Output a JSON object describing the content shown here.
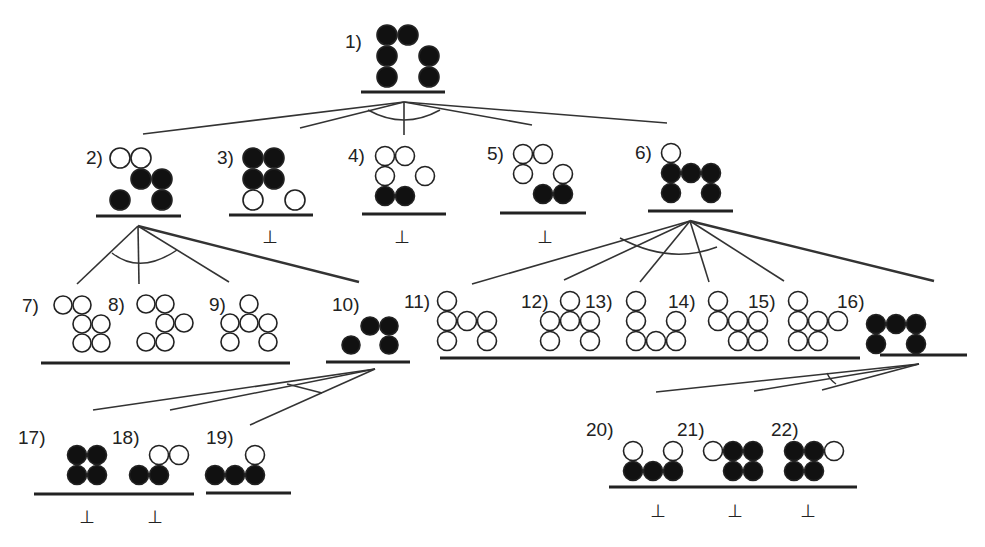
{
  "diagram": {
    "type": "search-tree",
    "colors": {
      "filled": "#111111",
      "hollow": "#ffffff",
      "stroke": "#222222",
      "line": "#333333"
    },
    "bottom_symbol": "⊥",
    "nodes": [
      {
        "id": "1",
        "label": "1)",
        "dead_end": false,
        "circles": [
          [
            0,
            0,
            1
          ],
          [
            1,
            0,
            1
          ],
          [
            0,
            1,
            1
          ],
          [
            2,
            1,
            1
          ],
          [
            0,
            2,
            1
          ],
          [
            2,
            2,
            1
          ]
        ]
      },
      {
        "id": "2",
        "label": "2)",
        "dead_end": false,
        "circles": [
          [
            0,
            0,
            0
          ],
          [
            1,
            0,
            0
          ],
          [
            1,
            1,
            1
          ],
          [
            2,
            1,
            1
          ],
          [
            0,
            2,
            1
          ],
          [
            2,
            2,
            1
          ]
        ]
      },
      {
        "id": "3",
        "label": "3)",
        "dead_end": true,
        "circles": [
          [
            0,
            0,
            1
          ],
          [
            1,
            0,
            1
          ],
          [
            0,
            1,
            1
          ],
          [
            1,
            1,
            1
          ],
          [
            0,
            2,
            0
          ],
          [
            2,
            2,
            0
          ]
        ]
      },
      {
        "id": "4",
        "label": "4)",
        "dead_end": true,
        "circles": [
          [
            0,
            0,
            0
          ],
          [
            1,
            0,
            0
          ],
          [
            0,
            1,
            0
          ],
          [
            2,
            1,
            0
          ],
          [
            0,
            2,
            1
          ],
          [
            1,
            2,
            1
          ]
        ]
      },
      {
        "id": "5",
        "label": "5)",
        "dead_end": true,
        "circles": [
          [
            0,
            0,
            0
          ],
          [
            1,
            0,
            0
          ],
          [
            0,
            1,
            0
          ],
          [
            2,
            1,
            0
          ],
          [
            1,
            2,
            1
          ],
          [
            2,
            2,
            1
          ]
        ]
      },
      {
        "id": "6",
        "label": "6)",
        "dead_end": false,
        "circles": [
          [
            0,
            0,
            0
          ],
          [
            0,
            1,
            1
          ],
          [
            1,
            1,
            1
          ],
          [
            2,
            1,
            1
          ],
          [
            0,
            2,
            1
          ],
          [
            2,
            2,
            1
          ]
        ]
      },
      {
        "id": "7",
        "label": "7)",
        "dead_end": false,
        "circles": [
          [
            0,
            0,
            0
          ],
          [
            1,
            0,
            0
          ],
          [
            1,
            1,
            0
          ],
          [
            2,
            1,
            0
          ],
          [
            1,
            2,
            0
          ],
          [
            2,
            2,
            0
          ]
        ]
      },
      {
        "id": "8",
        "label": "8)",
        "dead_end": false,
        "circles": [
          [
            0,
            0,
            0
          ],
          [
            1,
            0,
            0
          ],
          [
            1,
            1,
            0
          ],
          [
            2,
            1,
            0
          ],
          [
            0,
            2,
            0
          ],
          [
            1,
            2,
            0
          ]
        ]
      },
      {
        "id": "9",
        "label": "9)",
        "dead_end": false,
        "circles": [
          [
            1,
            0,
            0
          ],
          [
            0,
            1,
            0
          ],
          [
            1,
            1,
            0
          ],
          [
            2,
            1,
            0
          ],
          [
            0,
            2,
            0
          ],
          [
            2,
            2,
            0
          ]
        ]
      },
      {
        "id": "10",
        "label": "10)",
        "dead_end": false,
        "circles": [
          [
            1,
            1,
            1
          ],
          [
            2,
            1,
            1
          ],
          [
            0,
            2,
            1
          ],
          [
            2,
            2,
            1
          ]
        ]
      },
      {
        "id": "11",
        "label": "11)",
        "dead_end": false,
        "circles": [
          [
            0,
            0,
            0
          ],
          [
            0,
            1,
            0
          ],
          [
            1,
            1,
            0
          ],
          [
            2,
            1,
            0
          ],
          [
            0,
            2,
            0
          ],
          [
            2,
            2,
            0
          ]
        ]
      },
      {
        "id": "12",
        "label": "12)",
        "dead_end": false,
        "circles": [
          [
            1,
            0,
            0
          ],
          [
            0,
            1,
            0
          ],
          [
            1,
            1,
            0
          ],
          [
            2,
            1,
            0
          ],
          [
            0,
            2,
            0
          ],
          [
            2,
            2,
            0
          ]
        ]
      },
      {
        "id": "13",
        "label": "13)",
        "dead_end": false,
        "circles": [
          [
            0,
            0,
            0
          ],
          [
            0,
            1,
            0
          ],
          [
            2,
            1,
            0
          ],
          [
            0,
            2,
            0
          ],
          [
            1,
            2,
            0
          ],
          [
            2,
            2,
            0
          ]
        ]
      },
      {
        "id": "14",
        "label": "14)",
        "dead_end": false,
        "circles": [
          [
            0,
            0,
            0
          ],
          [
            0,
            1,
            0
          ],
          [
            1,
            1,
            0
          ],
          [
            2,
            1,
            0
          ],
          [
            1,
            2,
            0
          ],
          [
            2,
            2,
            0
          ]
        ]
      },
      {
        "id": "15",
        "label": "15)",
        "dead_end": false,
        "circles": [
          [
            0,
            0,
            0
          ],
          [
            0,
            1,
            0
          ],
          [
            1,
            1,
            0
          ],
          [
            2,
            1,
            0
          ],
          [
            0,
            2,
            0
          ],
          [
            1,
            2,
            0
          ]
        ]
      },
      {
        "id": "16",
        "label": "16)",
        "dead_end": false,
        "circles": [
          [
            0,
            1,
            1
          ],
          [
            1,
            1,
            1
          ],
          [
            2,
            1,
            1
          ],
          [
            0,
            2,
            1
          ],
          [
            2,
            2,
            1
          ]
        ]
      },
      {
        "id": "17",
        "label": "17)",
        "dead_end": true,
        "circles": [
          [
            0,
            1,
            1
          ],
          [
            1,
            1,
            1
          ],
          [
            0,
            2,
            1
          ],
          [
            1,
            2,
            1
          ]
        ]
      },
      {
        "id": "18",
        "label": "18)",
        "dead_end": true,
        "circles": [
          [
            1,
            1,
            0
          ],
          [
            2,
            1,
            0
          ],
          [
            0,
            2,
            1
          ],
          [
            1,
            2,
            1
          ]
        ]
      },
      {
        "id": "19",
        "label": "19)",
        "dead_end": false,
        "circles": [
          [
            2,
            1,
            0
          ],
          [
            0,
            2,
            1
          ],
          [
            1,
            2,
            1
          ],
          [
            2,
            2,
            1
          ]
        ]
      },
      {
        "id": "20",
        "label": "20)",
        "dead_end": true,
        "circles": [
          [
            0,
            1,
            0
          ],
          [
            2,
            1,
            0
          ],
          [
            0,
            2,
            1
          ],
          [
            1,
            2,
            1
          ],
          [
            2,
            2,
            1
          ]
        ]
      },
      {
        "id": "21",
        "label": "21)",
        "dead_end": true,
        "circles": [
          [
            0,
            1,
            0
          ],
          [
            1,
            1,
            1
          ],
          [
            2,
            1,
            1
          ],
          [
            1,
            2,
            1
          ],
          [
            2,
            2,
            1
          ]
        ]
      },
      {
        "id": "22",
        "label": "22)",
        "dead_end": true,
        "circles": [
          [
            0,
            1,
            1
          ],
          [
            1,
            1,
            1
          ],
          [
            2,
            1,
            0
          ],
          [
            0,
            2,
            1
          ],
          [
            1,
            2,
            1
          ]
        ]
      }
    ],
    "edges": [
      {
        "from": "1",
        "to": [
          "2",
          "3",
          "4",
          "5",
          "6"
        ]
      },
      {
        "from": "2",
        "to": [
          "7",
          "8",
          "9",
          "10"
        ]
      },
      {
        "from": "6",
        "to": [
          "11",
          "12",
          "13",
          "14",
          "15",
          "16"
        ]
      },
      {
        "from": "10",
        "to": [
          "17",
          "18",
          "19"
        ]
      },
      {
        "from": "16",
        "to": [
          "20",
          "21",
          "22"
        ]
      }
    ]
  }
}
